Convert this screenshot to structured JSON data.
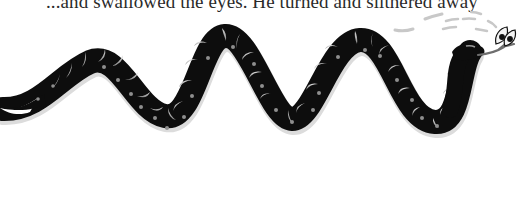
{
  "page": {
    "caption": "...and swallowed the eyes. He turned and slithered away",
    "illustration": {
      "subject": "black snake with grey crescent bands and grey dots, slithering right with forked tongue holding a pair of eyes",
      "colors": {
        "body": "#0d0d0d",
        "band": "#bdbdbd",
        "dot": "#8a8a8a",
        "outline": "#d9d9d9",
        "streak": "#c4c4c4"
      }
    }
  }
}
